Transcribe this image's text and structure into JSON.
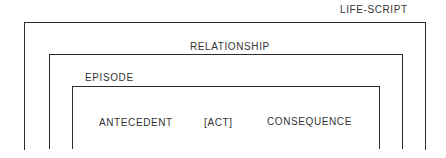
{
  "diagram": {
    "levels": [
      {
        "id": "life-script",
        "label": "LIFE-SCRIPT"
      },
      {
        "id": "relationship",
        "label": "RELATIONSHIP"
      },
      {
        "id": "episode",
        "label": "EPISODE"
      }
    ],
    "sequence": [
      {
        "label": "ANTECEDENT"
      },
      {
        "label": "[ACT]"
      },
      {
        "label": "CONSEQUENCE"
      }
    ]
  }
}
